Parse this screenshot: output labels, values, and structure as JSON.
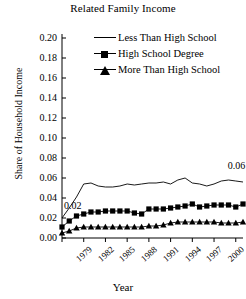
{
  "chart_data": {
    "type": "line",
    "title": "Related Family Income",
    "xlabel": "Year",
    "ylabel": "Share of Household Income",
    "ylim": [
      0.0,
      0.2
    ],
    "yticks": [
      "0.00",
      "0.02",
      "0.04",
      "0.06",
      "0.08",
      "0.10",
      "0.12",
      "0.14",
      "0.16",
      "0.18",
      "0.20"
    ],
    "xlim": [
      1979,
      2004
    ],
    "xticks": [
      "1979",
      "1982",
      "1985",
      "1988",
      "1991",
      "1994",
      "1997",
      "2000",
      "2003"
    ],
    "grid": false,
    "legend_position": "top-right",
    "x": [
      1979,
      1980,
      1981,
      1982,
      1983,
      1984,
      1985,
      1986,
      1987,
      1988,
      1989,
      1990,
      1991,
      1992,
      1993,
      1994,
      1995,
      1996,
      1997,
      1998,
      1999,
      2000,
      2001,
      2002,
      2003,
      2004
    ],
    "series": [
      {
        "name": "Less Than High School",
        "marker": "none",
        "values": [
          0.02,
          0.03,
          0.041,
          0.054,
          0.055,
          0.052,
          0.051,
          0.051,
          0.052,
          0.054,
          0.053,
          0.054,
          0.055,
          0.055,
          0.056,
          0.054,
          0.058,
          0.06,
          0.055,
          0.054,
          0.052,
          0.054,
          0.057,
          0.058,
          0.057,
          0.056
        ]
      },
      {
        "name": "High School Degree",
        "marker": "square",
        "values": [
          0.011,
          0.017,
          0.022,
          0.024,
          0.026,
          0.026,
          0.027,
          0.027,
          0.027,
          0.027,
          0.025,
          0.024,
          0.029,
          0.029,
          0.029,
          0.03,
          0.031,
          0.032,
          0.034,
          0.031,
          0.032,
          0.033,
          0.033,
          0.033,
          0.031,
          0.034
        ]
      },
      {
        "name": "More Than High School",
        "marker": "triangle",
        "values": [
          0.005,
          0.007,
          0.01,
          0.011,
          0.011,
          0.011,
          0.011,
          0.011,
          0.011,
          0.011,
          0.011,
          0.011,
          0.012,
          0.012,
          0.013,
          0.015,
          0.016,
          0.016,
          0.016,
          0.016,
          0.016,
          0.016,
          0.015,
          0.015,
          0.015,
          0.016
        ]
      }
    ],
    "annotations": [
      {
        "text": "0.02",
        "x": 1979,
        "y": 0.032,
        "name": "start-value-annotation"
      },
      {
        "text": "0.06",
        "x": 2003,
        "y": 0.072,
        "name": "end-value-annotation"
      }
    ],
    "colors": {
      "line": "#000000",
      "axis": "#000000",
      "background": "#ffffff"
    }
  }
}
